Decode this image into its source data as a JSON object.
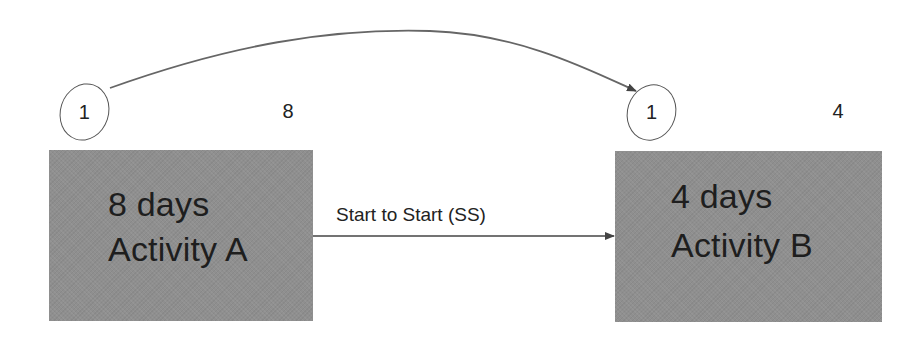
{
  "diagram": {
    "type": "precedence-network",
    "colors": {
      "box_fill": "#8f8f8f",
      "box_text": "#1e1e1e",
      "line": "#555555",
      "background": "#ffffff"
    },
    "activities": [
      {
        "id": "A",
        "duration_label": "8 days",
        "name_label": "Activity A",
        "start_marker": "1",
        "duration_marker": "8"
      },
      {
        "id": "B",
        "duration_label": "4 days",
        "name_label": "Activity B",
        "start_marker": "1",
        "duration_marker": "4"
      }
    ],
    "links": [
      {
        "from": "A",
        "to": "B",
        "label": "Start to Start (SS)",
        "style": "straight-arrow"
      },
      {
        "from": "A.start_marker",
        "to": "B.start_marker",
        "label": "",
        "style": "curved-arrow"
      }
    ]
  }
}
